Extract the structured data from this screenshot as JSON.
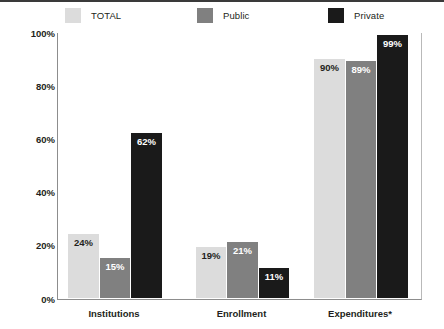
{
  "chart_data": {
    "type": "bar",
    "title": "",
    "subtitle": "",
    "xlabel": "",
    "ylabel": "",
    "categories": [
      "Institutions",
      "Enrollment",
      "Expenditures*"
    ],
    "series": [
      {
        "name": "TOTAL",
        "color": "#dcdcdc",
        "values": [
          24,
          19,
          90
        ],
        "labels": [
          "24%",
          "19%",
          "90%"
        ]
      },
      {
        "name": "Public",
        "color": "#808080",
        "values": [
          15,
          21,
          89
        ],
        "labels": [
          "15%",
          "21%",
          "89%"
        ]
      },
      {
        "name": "Private",
        "color": "#1a1a1a",
        "values": [
          62,
          11,
          99
        ],
        "labels": [
          "62%",
          "11%",
          "99%"
        ]
      }
    ],
    "ylim": [
      0,
      100
    ],
    "yticks": [
      0,
      20,
      40,
      60,
      80,
      100
    ],
    "ytick_labels": [
      "0%",
      "20%",
      "40%",
      "60%",
      "80%",
      "100%"
    ],
    "grid": false,
    "legend_position": "top-left",
    "value_labels": true
  },
  "legend": {
    "items": [
      {
        "label": "TOTAL",
        "color": "#dcdcdc"
      },
      {
        "label": "Public",
        "color": "#808080"
      },
      {
        "label": "Private",
        "color": "#1a1a1a"
      }
    ]
  }
}
